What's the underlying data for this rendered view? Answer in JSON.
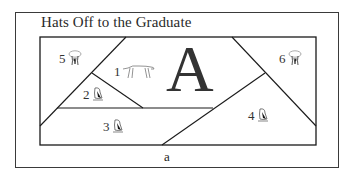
{
  "title": "Hats Off to the Graduate",
  "center_letter": "A",
  "bottom_label": "a",
  "pieces": [
    {
      "number": "1",
      "icon": "cheetah-icon"
    },
    {
      "number": "2",
      "icon": "penguin-icon"
    },
    {
      "number": "3",
      "icon": "penguin-icon"
    },
    {
      "number": "4",
      "icon": "penguin-icon"
    },
    {
      "number": "5",
      "icon": "elephant-icon"
    },
    {
      "number": "6",
      "icon": "elephant-icon"
    }
  ],
  "colors": {
    "line": "#1a1a1a",
    "frame": "#3a3a3a",
    "text": "#333333",
    "background": "#ffffff"
  }
}
